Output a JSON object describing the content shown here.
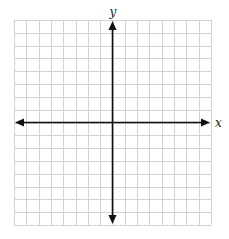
{
  "diagram": {
    "type": "coordinate-plane",
    "x_axis_label": "x",
    "y_axis_label": "y",
    "grid_columns": 16,
    "grid_rows": 16,
    "y_axis_at_column": 8,
    "x_axis_at_row": 8,
    "colors": {
      "grid": "#d2d2d2",
      "axis": "#111111",
      "label": "#222222"
    }
  }
}
